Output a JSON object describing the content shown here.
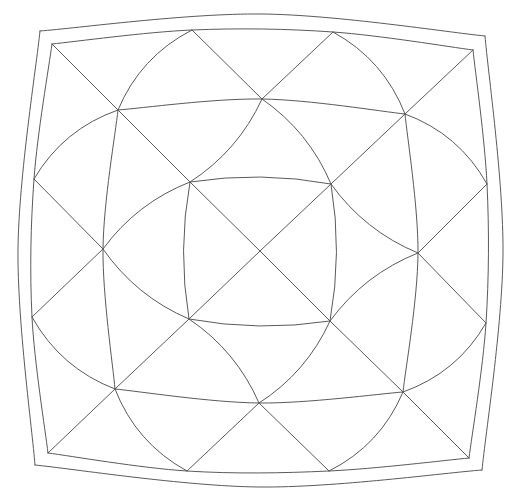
{
  "figure": {
    "stroke_color": "#5a5a5a",
    "background": "#ffffff"
  },
  "points": {
    "outerTL": [
      40,
      31
    ],
    "outerTR": [
      485,
      36
    ],
    "outerBR": [
      482,
      470
    ],
    "outerBL": [
      35,
      465
    ],
    "outerTopMid": [
      262,
      14
    ],
    "outerBottomMid": [
      259,
      487
    ],
    "outerLeftMid": [
      18,
      249
    ],
    "outerRightMid": [
      503,
      253
    ],
    "innerTL": [
      52,
      44
    ],
    "innerTR": [
      473,
      50
    ],
    "innerBR": [
      469,
      458
    ],
    "innerBL": [
      48,
      453
    ],
    "fT1": [
      192,
      30
    ],
    "fT2": [
      333,
      32
    ],
    "fB1": [
      187,
      471
    ],
    "fB2": [
      329,
      471
    ],
    "fL1": [
      34,
      179
    ],
    "fL2": [
      32,
      317
    ],
    "fR1": [
      487,
      184
    ],
    "fR2": [
      486,
      323
    ],
    "rTL": [
      118,
      110
    ],
    "rTM": [
      262,
      99
    ],
    "rTR": [
      405,
      114
    ],
    "rLM": [
      103,
      249
    ],
    "rRM": [
      418,
      253
    ],
    "rBL": [
      115,
      389
    ],
    "rBM": [
      259,
      403
    ],
    "rBR": [
      403,
      392
    ],
    "cTL": [
      190,
      182
    ],
    "cTR": [
      331,
      184
    ],
    "cBL": [
      189,
      319
    ],
    "cBR": [
      330,
      321
    ],
    "C": [
      260,
      251
    ]
  },
  "curves": [
    [
      "outerTL",
      "outerTopMid",
      "outerTR",
      0
    ],
    [
      "outerTR",
      "outerRightMid",
      "outerBR",
      0
    ],
    [
      "outerBR",
      "outerBottomMid",
      "outerBL",
      0
    ],
    [
      "outerBL",
      "outerLeftMid",
      "outerTL",
      0
    ],
    [
      "innerTL",
      "fT1",
      "fT2",
      "innerTR"
    ],
    [
      "innerTR",
      "fR1",
      "fR2",
      "innerBR"
    ],
    [
      "innerBR",
      "fB2",
      "fB1",
      "innerBL"
    ],
    [
      "innerBL",
      "fL2",
      "fL1",
      "innerTL"
    ],
    [
      "rTL",
      "rTM",
      "rTR",
      0
    ],
    [
      "rTR",
      "rRM",
      "rBR",
      0
    ],
    [
      "rBR",
      "rBM",
      "rBL",
      0
    ],
    [
      "rBL",
      "rLM",
      "rTL",
      0
    ],
    [
      "cTL",
      "cTR",
      6
    ],
    [
      "cTR",
      "cBR",
      6
    ],
    [
      "cBR",
      "cBL",
      6
    ],
    [
      "cBL",
      "cTL",
      6
    ],
    [
      "fT1",
      "rTL",
      10
    ],
    [
      "rTR",
      "fT2",
      10
    ],
    [
      "rBL",
      "fB1",
      10
    ],
    [
      "fB2",
      "rBR",
      10
    ],
    [
      "rTL",
      "fL1",
      10
    ],
    [
      "fL2",
      "rBL",
      10
    ],
    [
      "fR1",
      "rTR",
      10
    ],
    [
      "rBR",
      "fR2",
      10
    ],
    [
      "rTM",
      "cTR",
      8
    ],
    [
      "cTL",
      "rLM",
      8
    ],
    [
      "rLM",
      "cBL",
      8
    ],
    [
      "cBR",
      "rBM",
      8
    ],
    [
      "rBM",
      "cBL",
      -8
    ],
    [
      "cTL",
      "rTM",
      -8
    ],
    [
      "rRM",
      "cTR",
      -8
    ],
    [
      "cBR",
      "rRM",
      -8
    ]
  ],
  "lines": [
    [
      "innerTL",
      "rTL",
      "cTL",
      "C",
      "cBR",
      "rBR",
      "innerBR"
    ],
    [
      "innerTR",
      "rTR",
      "cTR",
      "C",
      "cBL",
      "rBL",
      "innerBL"
    ],
    [
      "fT1",
      "rTM"
    ],
    [
      "fT2",
      "rTM"
    ],
    [
      "fB1",
      "rBM"
    ],
    [
      "fB2",
      "rBM"
    ],
    [
      "fL1",
      "rLM"
    ],
    [
      "fL2",
      "rLM"
    ],
    [
      "fR1",
      "rRM"
    ],
    [
      "fR2",
      "rRM"
    ]
  ]
}
